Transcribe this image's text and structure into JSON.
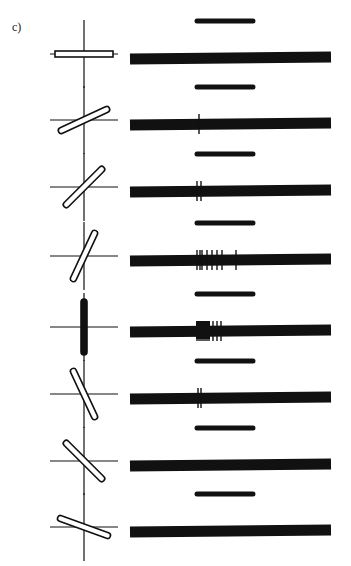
{
  "figure": {
    "panel_label": "c)",
    "rows": [
      {
        "orientation_deg": 0,
        "y": 54,
        "filled": false,
        "spikes": []
      },
      {
        "orientation_deg": -25,
        "y": 120,
        "filled": false,
        "spikes": [
          199
        ]
      },
      {
        "orientation_deg": -45,
        "y": 187,
        "filled": false,
        "spikes": [
          197,
          201
        ]
      },
      {
        "orientation_deg": -65,
        "y": 256,
        "filled": false,
        "spikes": [
          197,
          200,
          202,
          207,
          212,
          217,
          222,
          236
        ]
      },
      {
        "orientation_deg": -90,
        "y": 327,
        "filled": true,
        "spikes": [
          197,
          199,
          201,
          203,
          205,
          207,
          209,
          213,
          217,
          221
        ]
      },
      {
        "orientation_deg": 65,
        "y": 394,
        "filled": false,
        "spikes": [
          198,
          201
        ]
      },
      {
        "orientation_deg": 45,
        "y": 461,
        "filled": false,
        "spikes": []
      },
      {
        "orientation_deg": 20,
        "y": 527,
        "filled": false,
        "spikes": []
      }
    ],
    "stimulus_bar": {
      "x1": 197,
      "x2": 253
    },
    "trace": {
      "x1": 130,
      "x2": 331
    },
    "axis_x": 84,
    "ink_color": "#111111"
  }
}
